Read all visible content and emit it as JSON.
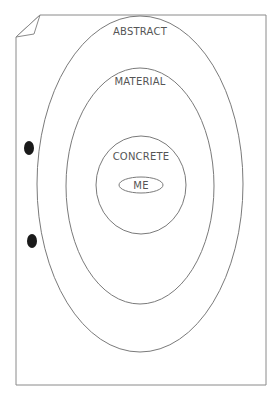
{
  "diagram": {
    "type": "concentric-ellipses",
    "levels": [
      {
        "label": "ABSTRACT",
        "order": 1
      },
      {
        "label": "MATERIAL",
        "order": 2
      },
      {
        "label": "CONCRETE",
        "order": 3
      },
      {
        "label": "ME",
        "order": 4
      }
    ],
    "page": {
      "style": "paper sheet with folded top-left corner and two punch holes"
    },
    "colors": {
      "stroke": "#7a7a7a",
      "text": "#555555",
      "hole": "#1a1a1a",
      "background": "#ffffff"
    }
  }
}
